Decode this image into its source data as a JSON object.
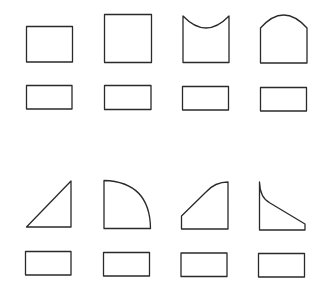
{
  "figure": {
    "stroke_color": "#2a2a2a",
    "background": "#ffffff",
    "rows": [
      {
        "shapes": [
          {
            "name": "rectangle",
            "label": ""
          },
          {
            "name": "square",
            "label": ""
          },
          {
            "name": "concave-top-rectangle",
            "label": ""
          },
          {
            "name": "arched-top-rectangle",
            "label": ""
          }
        ]
      },
      {
        "shapes": [
          {
            "name": "right-triangle",
            "label": ""
          },
          {
            "name": "quarter-circle",
            "label": ""
          },
          {
            "name": "curved-ramp",
            "label": ""
          },
          {
            "name": "concave-slope",
            "label": ""
          }
        ]
      }
    ]
  }
}
